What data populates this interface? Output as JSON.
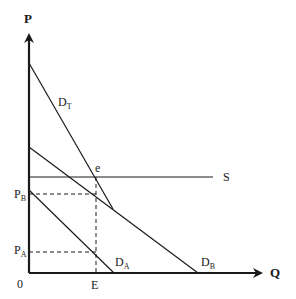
{
  "diagram": {
    "axes": {
      "y_label": "P",
      "x_label": "Q",
      "origin_label": "0"
    },
    "curves": {
      "total_demand": {
        "main": "D",
        "sub": "T"
      },
      "demand_a": {
        "main": "D",
        "sub": "A"
      },
      "demand_b": {
        "main": "D",
        "sub": "B"
      },
      "supply": {
        "main": "S"
      }
    },
    "points": {
      "equilibrium": "e"
    },
    "y_ticks": {
      "price_b": {
        "main": "P",
        "sub": "B"
      },
      "price_a": {
        "main": "P",
        "sub": "A"
      }
    },
    "x_ticks": {
      "quantity_e": "E"
    },
    "colors": {
      "ink": "#1a1a1a",
      "background": "#ffffff"
    }
  }
}
